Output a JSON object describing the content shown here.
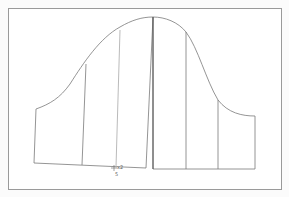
{
  "diagram": {
    "type": "pattern-pieces",
    "frame": {
      "x": 8,
      "y": 8,
      "width": 273,
      "height": 182,
      "stroke": "#9a9a9a"
    },
    "colors": {
      "line": "#7a7a7a",
      "frame": "#9a9a9a",
      "background": "#fbfbfb"
    },
    "pieces": [
      {
        "name": "left-piece",
        "outline_points": "34,163 36,109 146,168",
        "slash_lines": [
          {
            "x1": 86,
            "y1": 64,
            "x2": 82,
            "y2": 165
          },
          {
            "x1": 120,
            "y1": 30,
            "x2": 116,
            "y2": 167
          }
        ]
      },
      {
        "name": "right-piece",
        "slash_lines": [
          {
            "x1": 186,
            "y1": 32,
            "x2": 186,
            "y2": 169
          },
          {
            "x1": 218,
            "y1": 100,
            "x2": 218,
            "y2": 169
          }
        ]
      }
    ],
    "annotation": {
      "marker": "+",
      "text_top": "x2",
      "text_bottom": "5"
    }
  }
}
